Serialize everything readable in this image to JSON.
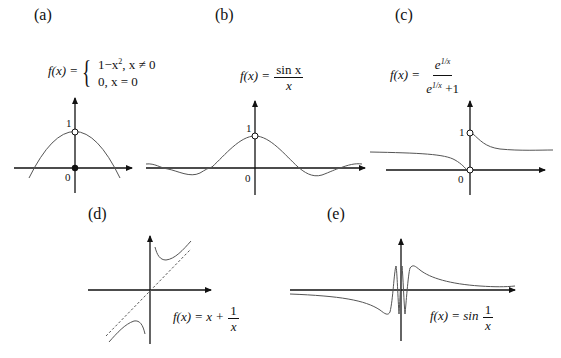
{
  "figure": {
    "panels": [
      {
        "id": "a",
        "label": "(a)",
        "formula": {
          "lhs": "f(x) =",
          "case1": "1 − x², x ≠ 0",
          "case1_expr": "1−x",
          "case1_exp": "2",
          "case1_cond": ", x ≠ 0",
          "case2": "0, x = 0"
        },
        "ticks": {
          "y1": "1",
          "origin": "0"
        },
        "features": [
          "parabola 1-x^2",
          "open circle at (0,1)",
          "filled dot at (0,0)"
        ]
      },
      {
        "id": "b",
        "label": "(b)",
        "formula": {
          "lhs": "f(x) =",
          "num": "sin x",
          "den": "x"
        },
        "ticks": {
          "y1": "1",
          "origin": "0"
        },
        "features": [
          "sinc curve",
          "open circle at (0,1)"
        ]
      },
      {
        "id": "c",
        "label": "(c)",
        "formula": {
          "lhs": "f(x) =",
          "num_base": "e",
          "num_exp": "1/x",
          "den_base": "e",
          "den_exp": "1/x",
          "den_tail": "+1"
        },
        "ticks": {
          "y1": "1",
          "origin": "0"
        },
        "features": [
          "jump discontinuity at 0",
          "open circle at (0,1)",
          "open circle at (0,0)"
        ]
      },
      {
        "id": "d",
        "label": "(d)",
        "formula": {
          "lhs": "f(x) = x +",
          "num": "1",
          "den": "x"
        },
        "features": [
          "hyperbola branches",
          "dashed asymptote y=x"
        ]
      },
      {
        "id": "e",
        "label": "(e)",
        "formula": {
          "lhs": "f(x) = sin",
          "num": "1",
          "den": "x"
        },
        "features": [
          "oscillation near 0"
        ]
      }
    ],
    "colors": {
      "axis": "#111111",
      "curve": "#555555"
    }
  }
}
